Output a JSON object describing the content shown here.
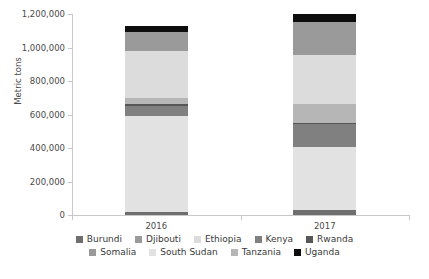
{
  "chart_data": {
    "type": "bar",
    "subtype": "stacked-column",
    "title": "",
    "subtitle": "",
    "xlabel": "",
    "ylabel": "Metric tons",
    "categories": [
      "2016",
      "2017"
    ],
    "ylim": [
      0,
      1200000
    ],
    "ytick_labels": [
      "0",
      "200,000",
      "400,000",
      "600,000",
      "800,000",
      "1,000,000",
      "1,200,000"
    ],
    "ytick_values": [
      0,
      200000,
      400000,
      600000,
      800000,
      1000000,
      1200000
    ],
    "grid": false,
    "legend_position": "bottom",
    "stack_order_bottom_to_top": [
      "Burundi",
      "South Sudan",
      "Kenya",
      "Rwanda",
      "Tanzania",
      "Ethiopia",
      "Somalia",
      "Uganda"
    ],
    "series": [
      {
        "name": "Burundi",
        "color": "#6e6e6e",
        "values": [
          20000,
          28000
        ]
      },
      {
        "name": "South Sudan",
        "color": "#e2e2e2",
        "values": [
          570000,
          380000
        ]
      },
      {
        "name": "Kenya",
        "color": "#808080",
        "values": [
          62000,
          133000
        ]
      },
      {
        "name": "Rwanda",
        "color": "#575757",
        "values": [
          10000,
          9000
        ]
      },
      {
        "name": "Tanzania",
        "color": "#b6b6b6",
        "values": [
          35000,
          113000
        ]
      },
      {
        "name": "Ethiopia",
        "color": "#dcdcdc",
        "values": [
          285000,
          290000
        ]
      },
      {
        "name": "Somalia",
        "color": "#9a9a9a",
        "values": [
          108000,
          202000
        ]
      },
      {
        "name": "Uganda",
        "color": "#0d0d0d",
        "values": [
          40000,
          45000
        ]
      }
    ],
    "totals": [
      1130000,
      1200000
    ]
  },
  "legend": {
    "rows": [
      [
        {
          "label": "Burundi",
          "color": "#6e6e6e"
        },
        {
          "label": "Djibouti",
          "color": "#9a9a9a"
        },
        {
          "label": "Ethiopia",
          "color": "#dcdcdc"
        },
        {
          "label": "Kenya",
          "color": "#808080"
        },
        {
          "label": "Rwanda",
          "color": "#575757"
        }
      ],
      [
        {
          "label": "Somalia",
          "color": "#9a9a9a"
        },
        {
          "label": "South Sudan",
          "color": "#e2e2e2"
        },
        {
          "label": "Tanzania",
          "color": "#b6b6b6"
        },
        {
          "label": "Uganda",
          "color": "#0d0d0d"
        }
      ]
    ]
  },
  "axis": {
    "y_title": "Metric tons"
  },
  "colors": {
    "axis_line": "#c8c8c8",
    "tick_text": "#4a4a4a",
    "legend_text": "#3a3a3a",
    "background": "#ffffff"
  }
}
